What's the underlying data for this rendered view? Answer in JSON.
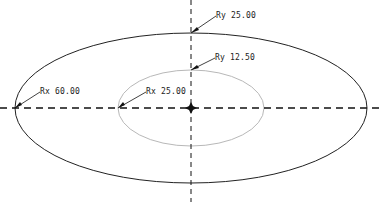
{
  "diagram": {
    "type": "ellipse-radius-dimensions",
    "center": {
      "x": 191,
      "y": 108
    },
    "axes": {
      "horizontal": {
        "style": "dashed",
        "color": "#111111"
      },
      "vertical": {
        "style": "dashed",
        "color": "#111111"
      }
    },
    "outer_ellipse": {
      "rx_px": 176,
      "ry_px": 75,
      "color": "#222222"
    },
    "inner_ellipse": {
      "rx_px": 73,
      "ry_px": 38,
      "color": "#b8b8b8"
    },
    "dimensions": [
      {
        "id": "outer-ry",
        "prefix": "Ry",
        "value": "25.00",
        "text": "Ry 25.00"
      },
      {
        "id": "inner-ry",
        "prefix": "Ry",
        "value": "12.50",
        "text": "Ry 12.50"
      },
      {
        "id": "outer-rx",
        "prefix": "Rx",
        "value": "60.00",
        "text": "Rx 60.00"
      },
      {
        "id": "inner-rx",
        "prefix": "Rx",
        "value": "25.00",
        "text": "Rx 25.00"
      }
    ]
  }
}
